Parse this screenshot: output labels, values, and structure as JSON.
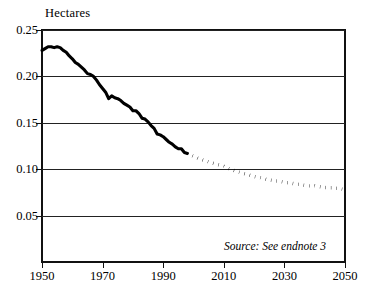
{
  "chart_data": {
    "type": "line",
    "title": "",
    "subtitle": "",
    "xlabel": "",
    "ylabel": "Hectares",
    "ylabel_position": "top-left",
    "xlim": [
      1950,
      2050
    ],
    "ylim": [
      0.0,
      0.25
    ],
    "grid": true,
    "grid_axis": "y",
    "legend": "none",
    "y_ticks": [
      "0.05",
      "0.10",
      "0.15",
      "0.20",
      "0.25"
    ],
    "y_tick_values": [
      0.05,
      0.1,
      0.15,
      0.2,
      0.25
    ],
    "x_ticks": [
      "1950",
      "1970",
      "1990",
      "2010",
      "2030",
      "2050"
    ],
    "x_tick_values": [
      1950,
      1970,
      1990,
      2010,
      2030,
      2050
    ],
    "annotations": [
      {
        "name": "source-note",
        "text": "Source: See endnote 3",
        "style": "italic",
        "position": "bottom-right"
      }
    ],
    "series": [
      {
        "name": "Grain area per person, historical",
        "style": "solid",
        "color": "#000000",
        "x": [
          1950,
          1951,
          1952,
          1953,
          1954,
          1955,
          1956,
          1957,
          1958,
          1959,
          1960,
          1961,
          1962,
          1963,
          1964,
          1965,
          1966,
          1967,
          1968,
          1969,
          1970,
          1971,
          1972,
          1973,
          1974,
          1975,
          1976,
          1977,
          1978,
          1979,
          1980,
          1981,
          1982,
          1983,
          1984,
          1985,
          1986,
          1987,
          1988,
          1989,
          1990,
          1991,
          1992,
          1993,
          1994,
          1995,
          1996,
          1997,
          1998
        ],
        "values": [
          0.228,
          0.23,
          0.232,
          0.232,
          0.231,
          0.232,
          0.231,
          0.228,
          0.226,
          0.222,
          0.219,
          0.215,
          0.213,
          0.21,
          0.207,
          0.203,
          0.202,
          0.2,
          0.196,
          0.191,
          0.187,
          0.183,
          0.176,
          0.179,
          0.177,
          0.176,
          0.174,
          0.171,
          0.169,
          0.167,
          0.163,
          0.163,
          0.16,
          0.155,
          0.154,
          0.151,
          0.147,
          0.144,
          0.138,
          0.137,
          0.135,
          0.132,
          0.129,
          0.127,
          0.124,
          0.122,
          0.122,
          0.118,
          0.117
        ]
      },
      {
        "name": "Grain area per person, projected",
        "style": "dotted",
        "color": "#000000",
        "x": [
          1998,
          2000,
          2002,
          2004,
          2006,
          2008,
          2010,
          2012,
          2014,
          2016,
          2018,
          2020,
          2022,
          2024,
          2026,
          2028,
          2030,
          2032,
          2034,
          2036,
          2038,
          2040,
          2042,
          2044,
          2046,
          2048,
          2050
        ],
        "values": [
          0.117,
          0.114,
          0.111,
          0.109,
          0.107,
          0.105,
          0.103,
          0.1,
          0.098,
          0.096,
          0.094,
          0.092,
          0.091,
          0.089,
          0.088,
          0.087,
          0.086,
          0.085,
          0.084,
          0.083,
          0.082,
          0.082,
          0.081,
          0.08,
          0.08,
          0.079,
          0.078
        ]
      }
    ]
  }
}
